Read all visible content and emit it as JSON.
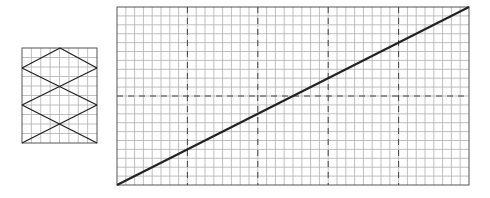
{
  "diagram": {
    "small_grid": {
      "x": 22,
      "y": 48,
      "width": 75,
      "height": 95,
      "cols": 8,
      "rows": 10,
      "zigzag_points": [
        [
          22,
          68
        ],
        [
          97,
          48
        ],
        [
          22,
          68
        ]
      ],
      "lines": [
        [
          [
            60,
            48
          ],
          [
            22,
            68
          ]
        ],
        [
          [
            60,
            48
          ],
          [
            97,
            68
          ]
        ],
        [
          [
            22,
            68
          ],
          [
            97,
            105
          ]
        ],
        [
          [
            97,
            68
          ],
          [
            22,
            105
          ]
        ],
        [
          [
            22,
            105
          ],
          [
            97,
            143
          ]
        ],
        [
          [
            97,
            105
          ],
          [
            22,
            143
          ]
        ]
      ]
    },
    "large_grid": {
      "x": 117,
      "y": 7,
      "width": 352,
      "height": 178,
      "cols": 40,
      "rows": 20,
      "dashed_x": [
        187.4,
        257.8,
        328.2,
        398.6
      ],
      "dashed_y": [
        96
      ],
      "diagonal": [
        [
          117,
          185
        ],
        [
          469,
          7
        ]
      ]
    },
    "colors": {
      "grid": "#b0b0b0",
      "border": "#555555",
      "dash": "#444444",
      "line": "#222222"
    }
  }
}
